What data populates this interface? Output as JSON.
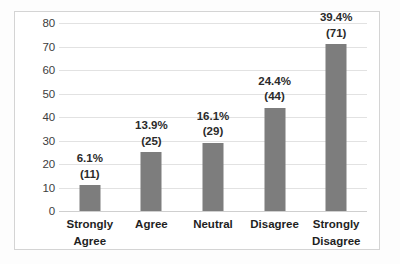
{
  "chart_data": {
    "type": "bar",
    "title": "",
    "subtitle": "",
    "xlabel": "",
    "ylabel": "",
    "categories": [
      "Strongly Agree",
      "Agree",
      "Neutral",
      "Disagree",
      "Strongly Disagree"
    ],
    "category_lines": [
      [
        "Strongly",
        "Agree"
      ],
      [
        "Agree"
      ],
      [
        "Neutral"
      ],
      [
        "Disagree"
      ],
      [
        "Strongly",
        "Disagree"
      ]
    ],
    "values": [
      11,
      25,
      29,
      44,
      71
    ],
    "percent_labels": [
      "6.1%",
      "13.9%",
      "16.1%",
      "24.4%",
      "39.4%"
    ],
    "count_labels": [
      "(11)",
      "(25)",
      "(29)",
      "(44)",
      "(71)"
    ],
    "ylim": [
      0,
      80
    ],
    "yticks": [
      0,
      10,
      20,
      30,
      40,
      50,
      60,
      70,
      80
    ],
    "ytick_labels": [
      "0",
      "10",
      "20",
      "30",
      "40",
      "50",
      "60",
      "70",
      "80"
    ],
    "grid": true,
    "legend": false,
    "legend_position": "none",
    "bar_color": "#7d7d7d",
    "gridline_color": "#e2e2e2",
    "frame_color": "#d4d4d4",
    "background_color": "#ffffff"
  }
}
